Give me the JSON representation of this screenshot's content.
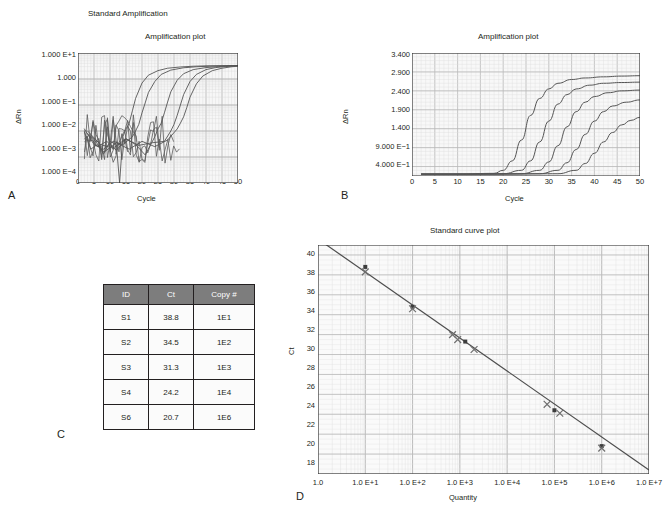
{
  "figure": {
    "title": "Standard Amplification",
    "caption_clipped": ""
  },
  "panelA": {
    "letter": "A",
    "title": "Amplification plot",
    "ylabel": "ΔRn",
    "xlabel": "Cycle",
    "yticks": [
      "1.000 E+1",
      "1.000",
      "1.000 E−1",
      "1.000 E−2",
      "1.000 E−3",
      "1.000 E−4"
    ],
    "xticks": [
      "0",
      "5",
      "10",
      "15",
      "20",
      "25",
      "30",
      "35",
      "40",
      "45",
      "50"
    ]
  },
  "panelB": {
    "letter": "B",
    "title": "Amplification plot",
    "ylabel": "ΔRn",
    "xlabel": "Cycle",
    "yticks": [
      "3.400",
      "2.900",
      "2.400",
      "1.900",
      "1.400",
      "9.000 E−1",
      "4.000 E−1"
    ],
    "xticks": [
      "0",
      "5",
      "10",
      "15",
      "20",
      "25",
      "30",
      "35",
      "40",
      "45",
      "50"
    ]
  },
  "panelC": {
    "letter": "C",
    "headers": [
      "ID",
      "Ct",
      "Copy #"
    ],
    "rows": [
      {
        "id": "S1",
        "ct": "38.8",
        "copy": "1E1"
      },
      {
        "id": "S2",
        "ct": "34.5",
        "copy": "1E2"
      },
      {
        "id": "S3",
        "ct": "31.3",
        "copy": "1E3"
      },
      {
        "id": "S4",
        "ct": "24.2",
        "copy": "1E4"
      },
      {
        "id": "S6",
        "ct": "20.7",
        "copy": "1E6"
      }
    ]
  },
  "panelD": {
    "letter": "D",
    "title": "Standard curve plot",
    "ylabel": "Ct",
    "xlabel": "Quantity",
    "yticks": [
      "40",
      "38",
      "36",
      "34",
      "32",
      "30",
      "28",
      "26",
      "24",
      "22",
      "20",
      "18"
    ],
    "xticks": [
      "1.0",
      "1.0 E+1",
      "1.0 E+2",
      "1.0 E+3",
      "1.0 E+4",
      "1.0 E+5",
      "1.0 E+6",
      "1.0 E+7"
    ]
  },
  "chart_data": [
    {
      "type": "line",
      "panel": "A",
      "title": "Amplification plot",
      "xlabel": "Cycle",
      "ylabel": "ΔRn",
      "xlim": [
        0,
        50
      ],
      "ylim": [
        0.0001,
        10
      ],
      "yscale": "log",
      "grid": true,
      "series": [
        {
          "name": "1E6",
          "ct": 16.5,
          "x": [
            2,
            4,
            6,
            8,
            10,
            12,
            13,
            14,
            15,
            16,
            17,
            18,
            20,
            22,
            25,
            28,
            32,
            36,
            40,
            45,
            50
          ],
          "y": [
            0.009,
            0.002,
            0.003,
            0.0013,
            0.004,
            0.003,
            0.0001,
            0.006,
            0.012,
            0.02,
            0.06,
            0.18,
            0.7,
            1.4,
            2.1,
            2.6,
            2.9,
            3.1,
            3.2,
            3.25,
            3.3
          ]
        },
        {
          "name": "1E4",
          "ct": 19.5,
          "x": [
            2,
            5,
            8,
            11,
            14,
            17,
            18,
            19,
            20,
            21,
            22,
            24,
            26,
            29,
            33,
            37,
            41,
            45,
            50
          ],
          "y": [
            0.012,
            0.003,
            0.002,
            0.004,
            0.003,
            0.006,
            0.01,
            0.018,
            0.05,
            0.12,
            0.3,
            0.8,
            1.5,
            2.2,
            2.7,
            2.95,
            3.1,
            3.2,
            3.3
          ]
        },
        {
          "name": "1E3",
          "ct": 26.5,
          "x": [
            3,
            6,
            9,
            12,
            15,
            18,
            21,
            24,
            25,
            26,
            27,
            28,
            29,
            31,
            33,
            36,
            40,
            44,
            47,
            50
          ],
          "y": [
            0.008,
            0.0025,
            0.004,
            0.0018,
            0.005,
            0.003,
            0.0012,
            0.006,
            0.012,
            0.02,
            0.05,
            0.13,
            0.32,
            0.9,
            1.6,
            2.3,
            2.75,
            3.0,
            3.15,
            3.25
          ]
        },
        {
          "name": "1E2",
          "ct": 30.5,
          "x": [
            3,
            7,
            11,
            15,
            19,
            23,
            27,
            29,
            30,
            31,
            32,
            33,
            35,
            37,
            40,
            43,
            46,
            50
          ],
          "y": [
            0.01,
            0.003,
            0.0022,
            0.005,
            0.0028,
            0.0035,
            0.004,
            0.01,
            0.018,
            0.04,
            0.1,
            0.25,
            0.8,
            1.5,
            2.3,
            2.75,
            3.0,
            3.2
          ]
        },
        {
          "name": "1E1",
          "ct": 33.0,
          "x": [
            4,
            8,
            12,
            16,
            20,
            24,
            28,
            31,
            32,
            33,
            34,
            35,
            37,
            39,
            42,
            45,
            48,
            50
          ],
          "y": [
            0.007,
            0.0015,
            0.0035,
            0.002,
            0.004,
            0.0025,
            0.0045,
            0.012,
            0.02,
            0.035,
            0.08,
            0.2,
            0.65,
            1.3,
            2.1,
            2.6,
            2.95,
            3.1
          ]
        }
      ]
    },
    {
      "type": "line",
      "panel": "B",
      "title": "Amplification plot",
      "xlabel": "Cycle",
      "ylabel": "ΔRn",
      "xlim": [
        0,
        50
      ],
      "ylim": [
        0.15,
        3.4
      ],
      "yscale": "linear",
      "grid": true,
      "series": [
        {
          "name": "S6 (1E6)",
          "x": [
            2,
            10,
            18,
            20,
            22,
            24,
            26,
            28,
            30,
            32,
            35,
            38,
            42,
            46,
            50
          ],
          "y": [
            0.2,
            0.2,
            0.22,
            0.3,
            0.55,
            1.1,
            1.75,
            2.2,
            2.45,
            2.6,
            2.7,
            2.74,
            2.77,
            2.79,
            2.8
          ]
        },
        {
          "name": "S4 (1E4)",
          "x": [
            2,
            12,
            20,
            24,
            26,
            28,
            30,
            32,
            34,
            36,
            39,
            42,
            46,
            50
          ],
          "y": [
            0.2,
            0.2,
            0.21,
            0.3,
            0.55,
            1.05,
            1.6,
            2.05,
            2.3,
            2.45,
            2.55,
            2.6,
            2.62,
            2.63
          ]
        },
        {
          "name": "S3 (1E3)",
          "x": [
            2,
            14,
            24,
            28,
            30,
            32,
            34,
            36,
            38,
            40,
            43,
            46,
            50
          ],
          "y": [
            0.2,
            0.2,
            0.21,
            0.3,
            0.52,
            0.95,
            1.45,
            1.85,
            2.1,
            2.25,
            2.35,
            2.4,
            2.42
          ]
        },
        {
          "name": "S2 (1E2)",
          "x": [
            2,
            16,
            28,
            32,
            34,
            36,
            38,
            40,
            42,
            44,
            47,
            50
          ],
          "y": [
            0.2,
            0.2,
            0.21,
            0.3,
            0.5,
            0.85,
            1.25,
            1.6,
            1.85,
            2.0,
            2.1,
            2.16
          ]
        },
        {
          "name": "S1 (1E1)",
          "x": [
            2,
            18,
            32,
            36,
            38,
            40,
            42,
            44,
            46,
            48,
            50
          ],
          "y": [
            0.2,
            0.2,
            0.21,
            0.3,
            0.48,
            0.75,
            1.05,
            1.3,
            1.5,
            1.62,
            1.7
          ]
        }
      ]
    },
    {
      "type": "scatter",
      "panel": "D",
      "title": "Standard curve plot",
      "xlabel": "Quantity",
      "ylabel": "Ct",
      "xscale": "log",
      "xlim": [
        1,
        10000000
      ],
      "ylim": [
        18,
        41
      ],
      "grid": true,
      "fit_line": {
        "x": [
          1,
          10000000
        ],
        "y": [
          41.6,
          18.4
        ]
      },
      "points": [
        {
          "quantity": 10,
          "ct": 38.8,
          "marker": "square"
        },
        {
          "quantity": 10,
          "ct": 38.3,
          "marker": "cross"
        },
        {
          "quantity": 100,
          "ct": 34.8,
          "marker": "square"
        },
        {
          "quantity": 100,
          "ct": 34.6,
          "marker": "cross"
        },
        {
          "quantity": 700,
          "ct": 32.0,
          "marker": "cross"
        },
        {
          "quantity": 900,
          "ct": 31.5,
          "marker": "cross"
        },
        {
          "quantity": 1300,
          "ct": 31.3,
          "marker": "square"
        },
        {
          "quantity": 2000,
          "ct": 30.5,
          "marker": "cross"
        },
        {
          "quantity": 70000,
          "ct": 25.0,
          "marker": "cross"
        },
        {
          "quantity": 100000,
          "ct": 24.4,
          "marker": "square"
        },
        {
          "quantity": 130000,
          "ct": 24.1,
          "marker": "cross"
        },
        {
          "quantity": 1000000,
          "ct": 20.8,
          "marker": "square"
        },
        {
          "quantity": 1000000,
          "ct": 20.6,
          "marker": "cross"
        }
      ]
    }
  ]
}
